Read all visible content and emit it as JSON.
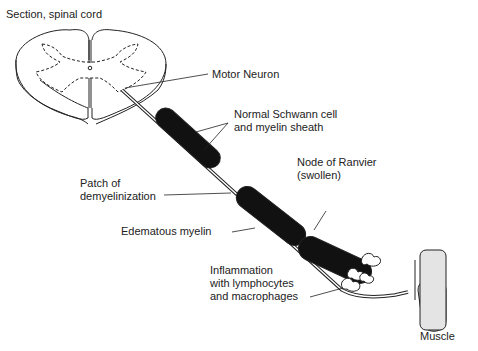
{
  "title": "Section, spinal cord",
  "labels": {
    "motor_neuron": "Motor Neuron",
    "schwann_line1": "Normal Schwann cell",
    "schwann_line2": "and myelin sheath",
    "patch_line1": "Patch of",
    "patch_line2": "demyelinization",
    "ranvier_line1": "Node of Ranvier",
    "ranvier_line2": "(swollen)",
    "edematous": "Edematous myelin",
    "inflam_line1": "Inflammation",
    "inflam_line2": "with lymphocytes",
    "inflam_line3": "and macrophages",
    "muscle": "Muscle"
  }
}
